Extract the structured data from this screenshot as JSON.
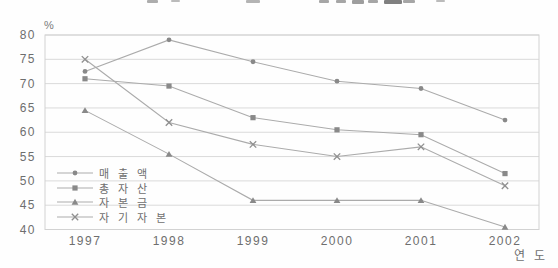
{
  "figure": {
    "title": "",
    "title_clipped": true
  },
  "chart_data": {
    "type": "line",
    "title": "",
    "xlabel": "연 도",
    "ylabel": "%",
    "categories": [
      "1997",
      "1998",
      "1999",
      "2000",
      "2001",
      "2002"
    ],
    "yticks": [
      80,
      75,
      70,
      65,
      60,
      55,
      50,
      45,
      40
    ],
    "ylim": [
      40,
      80
    ],
    "grid": "horizontal",
    "legend_position": "inside-bottom-left",
    "series": [
      {
        "name": "매 출 액",
        "marker": "circle",
        "values": [
          72.5,
          79.0,
          74.5,
          70.5,
          69.0,
          62.5
        ]
      },
      {
        "name": "총 자 산",
        "marker": "square",
        "values": [
          71.0,
          69.5,
          63.0,
          60.5,
          59.5,
          51.5
        ]
      },
      {
        "name": "자 본 금",
        "marker": "triangle",
        "values": [
          64.5,
          55.5,
          46.0,
          46.0,
          46.0,
          40.5
        ]
      },
      {
        "name": "자 기 자 본",
        "marker": "x",
        "values": [
          75.0,
          62.0,
          57.5,
          55.0,
          57.0,
          49.0
        ]
      }
    ]
  },
  "colors": {
    "background": "#fefefe",
    "plot_border": "#d2d2d2",
    "gridline": "#dadada",
    "series_line": "#ababab",
    "marker_fill": "#898989",
    "marker_stroke": "#8f8f8f",
    "text": "#6e6e6e",
    "title_fragment": "#6a6a6a"
  },
  "clipped_title_fragments": [
    {
      "x": 147,
      "w": 11,
      "h": 3,
      "o": 0.55
    },
    {
      "x": 171,
      "w": 9,
      "h": 2,
      "o": 0.45
    },
    {
      "x": 246,
      "w": 14,
      "h": 3,
      "o": 0.5
    },
    {
      "x": 319,
      "w": 10,
      "h": 3,
      "o": 0.6
    },
    {
      "x": 336,
      "w": 10,
      "h": 3,
      "o": 0.6
    },
    {
      "x": 352,
      "w": 12,
      "h": 4,
      "o": 0.65
    },
    {
      "x": 368,
      "w": 10,
      "h": 3,
      "o": 0.6
    },
    {
      "x": 384,
      "w": 18,
      "h": 4,
      "o": 0.85
    },
    {
      "x": 403,
      "w": 12,
      "h": 3,
      "o": 0.6
    },
    {
      "x": 436,
      "w": 9,
      "h": 2,
      "o": 0.45
    }
  ]
}
